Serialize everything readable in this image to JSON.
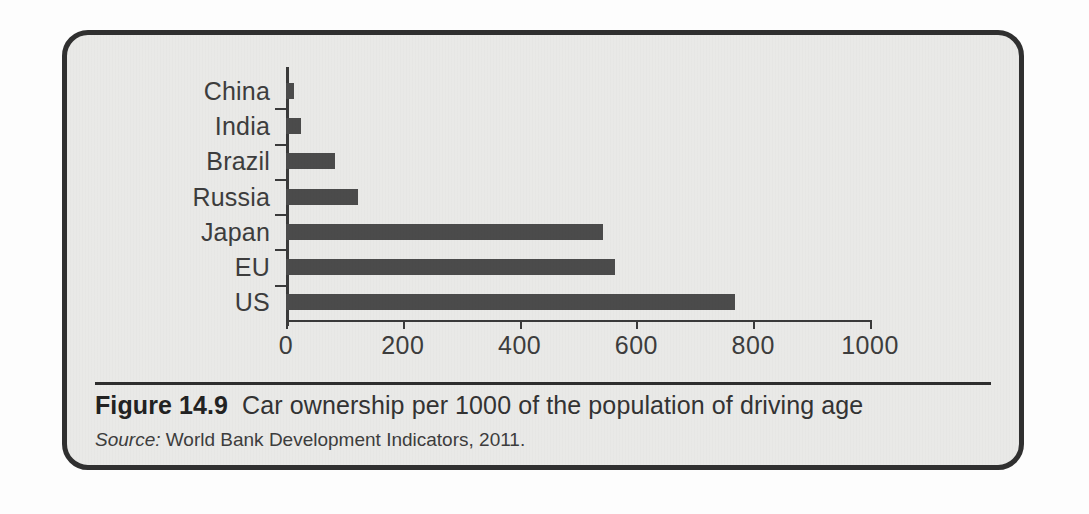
{
  "figure": {
    "caption_number": "Figure 14.9",
    "caption_text": "Car ownership per 1000 of the population of driving age",
    "source_label": "Source:",
    "source_text": "World Bank Development Indicators, 2011."
  },
  "colors": {
    "bar": "#4b4b4b",
    "panel_background": "#e9e9e7",
    "panel_border": "#303030",
    "axis": "#3a3a3a",
    "text": "#3d3d3d"
  },
  "chart_data": {
    "type": "bar",
    "orientation": "horizontal",
    "title": "Car ownership per 1000 of the population of driving age",
    "xlabel": "",
    "ylabel": "",
    "xlim": [
      0,
      1000
    ],
    "xticks": [
      0,
      200,
      400,
      600,
      800,
      1000
    ],
    "xtick_labels": [
      "0",
      "200",
      "400",
      "600",
      "800",
      "1000"
    ],
    "grid": false,
    "legend": false,
    "categories": [
      "China",
      "India",
      "Brazil",
      "Russia",
      "Japan",
      "EU",
      "US"
    ],
    "values": [
      14,
      26,
      84,
      123,
      542,
      563,
      769
    ]
  },
  "ghost_text": {
    "lines": [
      "on both economic stimulus of Brazil, Russia, India and China. The second is supply",
      "ing countries are the future they are providing fast and they are middle class consumers",
      "are developing cars but since they are smaller cars and payment of the impact on the",
      "world economies that is to domain it is that BRIC car ownership in these nations",
      "China in the BRIC countries are far lower than in more developed economies. The",
      "question that we can ask is the rise in income in these countries is China and India to",
      "more vehicles, significant impact on the oil and the environment at a global level",
      "major fuel cost."
    ],
    "tops": [
      5,
      34,
      63,
      92,
      148,
      177,
      206,
      235
    ]
  }
}
